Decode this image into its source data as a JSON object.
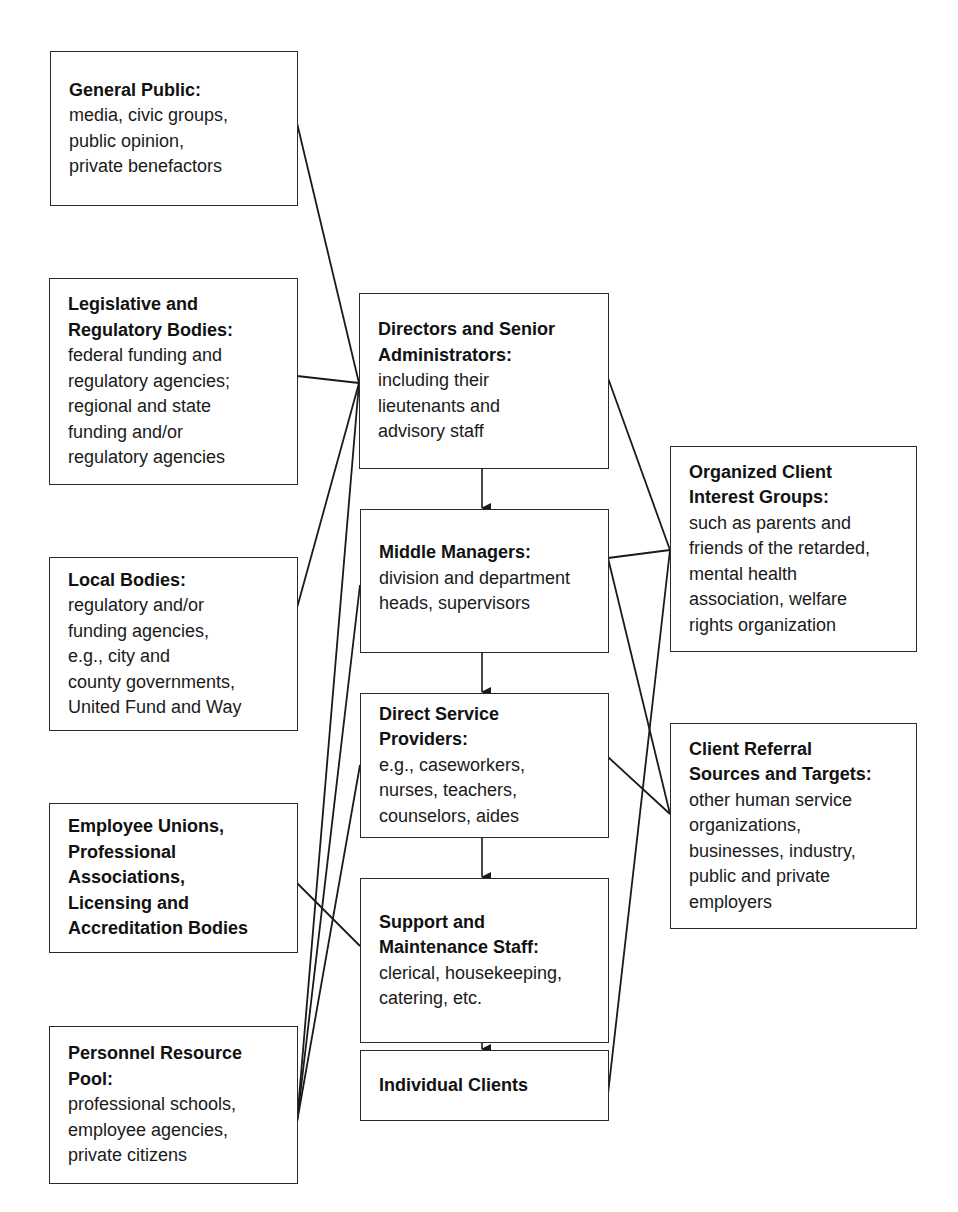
{
  "diagram": {
    "left_boxes": [
      {
        "id": "general-public",
        "title": "General Public:",
        "body": "media, civic groups,\npublic opinion,\nprivate benefactors"
      },
      {
        "id": "legislative",
        "title": "Legislative and\nRegulatory Bodies:",
        "body": "federal funding and\nregulatory agencies;\nregional and state\nfunding and/or\nregulatory agencies"
      },
      {
        "id": "local-bodies",
        "title": "Local Bodies:",
        "body": "regulatory and/or\nfunding agencies,\ne.g., city and\ncounty governments,\nUnited Fund and Way"
      },
      {
        "id": "employee-unions",
        "title": "Employee Unions,\nProfessional\nAssociations,\nLicensing and\nAccreditation Bodies",
        "body": ""
      },
      {
        "id": "personnel-pool",
        "title": "Personnel Resource\nPool:",
        "body": "professional schools,\nemployee agencies,\nprivate citizens"
      }
    ],
    "center_boxes": [
      {
        "id": "directors",
        "title": "Directors and Senior\nAdministrators:",
        "body": "including their\nlieutenants and\nadvisory staff"
      },
      {
        "id": "middle-managers",
        "title": "Middle Managers:",
        "body": "division and department\nheads, supervisors"
      },
      {
        "id": "direct-service",
        "title": "Direct Service\nProviders:",
        "body": "e.g., caseworkers,\nnurses, teachers,\ncounselors, aides"
      },
      {
        "id": "support-staff",
        "title": "Support and\nMaintenance Staff:",
        "body": "clerical, housekeeping,\ncatering, etc."
      },
      {
        "id": "individual-clients",
        "title": "Individual Clients",
        "body": ""
      }
    ],
    "right_boxes": [
      {
        "id": "organized-client",
        "title": "Organized Client\nInterest Groups:",
        "body": "such as parents and\nfriends of the retarded,\nmental health\nassociation, welfare\nrights organization"
      },
      {
        "id": "client-referral",
        "title": "Client Referral\nSources and Targets:",
        "body": "other human service\norganizations,\nbusinesses, industry,\npublic and private\nemployers"
      }
    ],
    "connections": [
      {
        "from": "general-public",
        "to": "directors"
      },
      {
        "from": "legislative",
        "to": "directors"
      },
      {
        "from": "local-bodies",
        "to": "directors"
      },
      {
        "from": "personnel-pool",
        "to": "directors"
      },
      {
        "from": "personnel-pool",
        "to": "middle-managers"
      },
      {
        "from": "personnel-pool",
        "to": "direct-service"
      },
      {
        "from": "employee-unions",
        "to": "support-staff"
      },
      {
        "from": "directors",
        "to": "organized-client"
      },
      {
        "from": "middle-managers",
        "to": "organized-client"
      },
      {
        "from": "individual-clients",
        "to": "organized-client"
      },
      {
        "from": "middle-managers",
        "to": "client-referral"
      },
      {
        "from": "direct-service",
        "to": "client-referral"
      }
    ],
    "hierarchy_arrows": [
      {
        "from": "directors",
        "to": "middle-managers"
      },
      {
        "from": "middle-managers",
        "to": "direct-service"
      },
      {
        "from": "direct-service",
        "to": "support-staff"
      },
      {
        "from": "support-staff",
        "to": "individual-clients"
      }
    ],
    "colors": {
      "line": "#1a1a1a",
      "border": "#2a2a2a",
      "background": "#ffffff"
    }
  }
}
